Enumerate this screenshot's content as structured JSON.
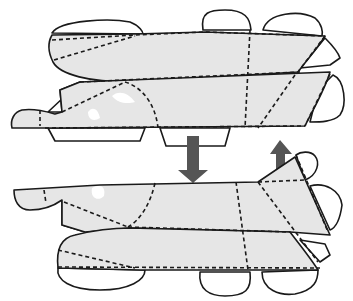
{
  "diagram": {
    "title": "",
    "pieces": [
      {
        "id": "top-piece",
        "label": "",
        "position": "upper"
      },
      {
        "id": "bottom-piece",
        "label": "",
        "position": "lower"
      }
    ],
    "arrows": [
      {
        "id": "arrow-down",
        "direction": "down",
        "color": "#555555"
      },
      {
        "id": "arrow-up",
        "direction": "up",
        "color": "#555555"
      }
    ],
    "line_styles": {
      "cut": "solid",
      "fold": "dashed"
    },
    "colors": {
      "panel_fill": "#e6e6e6",
      "outline": "#1a1a1a",
      "arrow": "#555555",
      "background": "#ffffff"
    }
  }
}
